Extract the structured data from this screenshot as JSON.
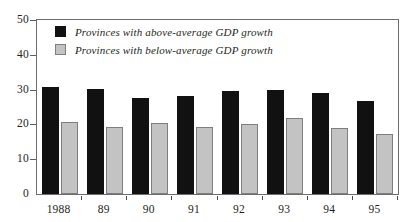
{
  "chart_data": {
    "type": "bar",
    "title": "",
    "xlabel": "",
    "ylabel": "",
    "categories": [
      "1988",
      "89",
      "90",
      "91",
      "92",
      "93",
      "94",
      "95"
    ],
    "series": [
      {
        "name": "Provinces with above-average GDP growth",
        "color": "#111111",
        "values": [
          30.7,
          30.2,
          27.7,
          28.3,
          29.7,
          30.0,
          28.9,
          26.8
        ]
      },
      {
        "name": "Provinces with below-average GDP growth",
        "color": "#c3c3c3",
        "values": [
          20.6,
          19.3,
          20.5,
          19.2,
          20.2,
          21.7,
          19.0,
          17.2
        ]
      }
    ],
    "ylim": [
      0,
      50
    ],
    "yticks": [
      0,
      10,
      20,
      30,
      40,
      50
    ],
    "ytick_labels": [
      "0",
      "10",
      "20",
      "30",
      "40",
      "50"
    ],
    "grid": false,
    "legend_position": "top-left"
  },
  "legend": {
    "items": [
      {
        "label": "Provinces with above-average GDP growth",
        "swatch": "above"
      },
      {
        "label": "Provinces with below-average GDP growth",
        "swatch": "below"
      }
    ]
  },
  "top_caption": ""
}
